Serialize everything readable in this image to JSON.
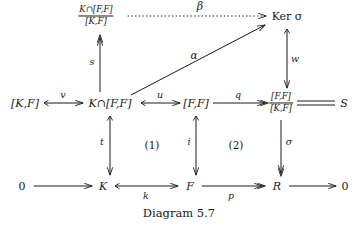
{
  "diagram": {
    "caption": "Diagram 5.7",
    "stroke_color": "#1a1a1a",
    "background": "#ffffff",
    "nodes": {
      "quotient_k_ff_over_kf": {
        "numerator": "K∩[F,F]",
        "denominator": "[K,F]",
        "x": 96,
        "y": 16
      },
      "ker_sigma": {
        "label": "Ker σ",
        "x": 287,
        "y": 16
      },
      "kf": {
        "label": "[K,F]",
        "x": 25,
        "y": 103
      },
      "k_cap_ff": {
        "label": "K∩[F,F]",
        "x": 110,
        "y": 103
      },
      "ff": {
        "label": "[F,F]",
        "x": 196,
        "y": 103
      },
      "quotient_ff_over_kf": {
        "numerator": "[F,F]",
        "denominator": "[K,F]",
        "x": 281,
        "y": 103
      },
      "s_object": {
        "label": "S",
        "x": 344,
        "y": 103
      },
      "zero_left": {
        "label": "0",
        "x": 22,
        "y": 186
      },
      "k": {
        "label": "K",
        "x": 103,
        "y": 186
      },
      "f": {
        "label": "F",
        "x": 190,
        "y": 186
      },
      "r": {
        "label": "R",
        "x": 277,
        "y": 186
      },
      "zero_right": {
        "label": "0",
        "x": 345,
        "y": 186
      }
    },
    "arrows": [
      {
        "name": "beta",
        "label": "β",
        "style": "dotted",
        "head": "simple",
        "from": "quotient_k_ff_over_kf",
        "to": "ker_sigma"
      },
      {
        "name": "alpha",
        "label": "α",
        "style": "solid",
        "head": "simple",
        "from": "k_cap_ff",
        "to": "ker_sigma"
      },
      {
        "name": "s",
        "label": "s",
        "style": "solid",
        "head": "epi",
        "direction": "up",
        "from": "k_cap_ff",
        "to": "quotient_k_ff_over_kf"
      },
      {
        "name": "w",
        "label": "w",
        "style": "solid",
        "head": "mono",
        "direction": "down",
        "from": "ker_sigma",
        "to": "quotient_ff_over_kf"
      },
      {
        "name": "v",
        "label": "v",
        "style": "solid",
        "head": "mono",
        "from": "kf",
        "to": "k_cap_ff"
      },
      {
        "name": "u",
        "label": "u",
        "style": "solid",
        "head": "mono",
        "from": "k_cap_ff",
        "to": "ff"
      },
      {
        "name": "q",
        "label": "q",
        "style": "solid",
        "head": "epi",
        "from": "ff",
        "to": "quotient_ff_over_kf"
      },
      {
        "name": "equality",
        "label": "",
        "style": "double-line",
        "head": "none",
        "from": "quotient_ff_over_kf",
        "to": "s_object"
      },
      {
        "name": "t",
        "label": "t",
        "style": "solid",
        "head": "mono",
        "direction": "down",
        "from": "k_cap_ff",
        "to": "k"
      },
      {
        "name": "i",
        "label": "i",
        "style": "solid",
        "head": "mono",
        "direction": "down",
        "from": "ff",
        "to": "f"
      },
      {
        "name": "sigma",
        "label": "σ",
        "style": "solid",
        "head": "epi",
        "direction": "down",
        "from": "quotient_ff_over_kf",
        "to": "r"
      },
      {
        "name": "zero-to-k",
        "label": "",
        "style": "solid",
        "head": "simple",
        "from": "zero_left",
        "to": "k"
      },
      {
        "name": "k-map",
        "label": "k",
        "style": "solid",
        "head": "mono",
        "from": "k",
        "to": "f"
      },
      {
        "name": "p",
        "label": "p",
        "style": "solid",
        "head": "epi",
        "from": "f",
        "to": "r"
      },
      {
        "name": "r-to-zero",
        "label": "",
        "style": "solid",
        "head": "simple",
        "from": "r",
        "to": "zero_right"
      }
    ],
    "region_labels": [
      {
        "name": "region-1",
        "label": "(1)",
        "x": 152,
        "y": 145
      },
      {
        "name": "region-2",
        "label": "(2)",
        "x": 236,
        "y": 145
      }
    ]
  }
}
